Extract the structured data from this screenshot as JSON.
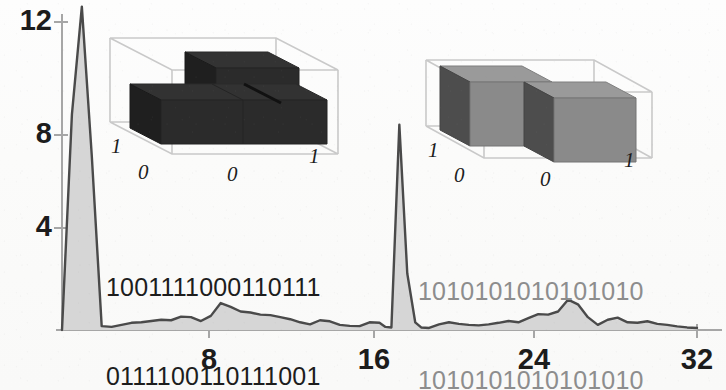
{
  "figure": {
    "kind": "scanned-scientific-figure",
    "background_color": "#fbfbfa"
  },
  "chart_data": {
    "type": "area",
    "title": "",
    "xlabel": "",
    "ylabel": "",
    "xlim": [
      0,
      32
    ],
    "ylim": [
      0,
      13.2
    ],
    "grid": false,
    "legend": null,
    "axis_color": "#8e8e8e",
    "line_color": "#4a4a4a",
    "fill_color": "#d6d6d6",
    "xticks": [
      8,
      16,
      24,
      32
    ],
    "xtick_labels": [
      "8",
      "16",
      "24",
      "32"
    ],
    "yticks": [
      4,
      8,
      12
    ],
    "ytick_labels": [
      "4",
      "8",
      "12"
    ],
    "series": [
      {
        "name": "spectrum",
        "x": [
          0,
          0.5,
          1.0,
          1.5,
          2.0,
          2.5,
          3.0,
          3.5,
          4.0,
          4.5,
          5.0,
          5.5,
          6.0,
          6.5,
          7.0,
          7.5,
          8.0,
          8.5,
          9.0,
          9.5,
          10.0,
          10.5,
          11.0,
          11.5,
          12.0,
          12.5,
          13.0,
          13.5,
          14.0,
          14.5,
          15.0,
          15.5,
          16.0,
          16.3,
          16.6,
          17.0,
          17.4,
          17.8,
          18.1,
          18.5,
          19.0,
          19.5,
          20.0,
          20.5,
          21.0,
          21.5,
          22.0,
          22.5,
          23.0,
          23.5,
          24.0,
          24.5,
          25.0,
          25.5,
          26.0,
          26.5,
          27.0,
          27.5,
          28.0,
          28.5,
          29.0,
          29.5,
          30.0,
          30.5,
          31.0,
          31.5,
          32.0
        ],
        "y": [
          0.0,
          8.4,
          12.6,
          6.8,
          0.15,
          0.12,
          0.2,
          0.28,
          0.3,
          0.35,
          0.4,
          0.38,
          0.52,
          0.5,
          0.35,
          0.55,
          1.05,
          0.9,
          0.72,
          0.68,
          0.6,
          0.58,
          0.5,
          0.42,
          0.3,
          0.22,
          0.38,
          0.34,
          0.2,
          0.16,
          0.15,
          0.3,
          0.28,
          0.12,
          0.1,
          8.0,
          2.2,
          0.3,
          0.1,
          0.08,
          0.22,
          0.3,
          0.24,
          0.2,
          0.18,
          0.22,
          0.28,
          0.35,
          0.3,
          0.46,
          0.62,
          0.6,
          0.72,
          1.18,
          1.0,
          0.5,
          0.2,
          0.4,
          0.48,
          0.3,
          0.28,
          0.34,
          0.24,
          0.2,
          0.14,
          0.1,
          0.08
        ]
      }
    ],
    "annotations": [
      {
        "name": "binary-left",
        "text_lines": [
          "1001111000110111",
          "0111100110111001"
        ],
        "color": "#1d1d1d"
      },
      {
        "name": "binary-right",
        "text_lines": [
          "1010101010101010",
          "1010101010101010"
        ],
        "color": "#8d8d8d"
      }
    ],
    "insets": [
      {
        "name": "inset-left",
        "type": "bar3d",
        "bar_color": "#2b2b2b",
        "bar_side_color": "#1c1c1c",
        "bar_top_color": "#333333",
        "frame_color": "#c9c9c9",
        "x_tick_labels": [
          "0",
          "1"
        ],
        "y_tick_labels": [
          "0",
          "1"
        ],
        "categories_x": [
          "0",
          "1"
        ],
        "categories_y": [
          "0",
          "1"
        ],
        "values": [
          [
            0.62,
            0.62
          ],
          [
            1.0,
            0.62
          ]
        ],
        "description": "3D bar chart, four bars, back-left bar tallest"
      },
      {
        "name": "inset-right",
        "type": "bar3d",
        "bar_color": "#8a8a8a",
        "bar_side_color": "#4e4e4e",
        "bar_top_color": "#9c9c9c",
        "frame_color": "#c9c9c9",
        "x_tick_labels": [
          "0",
          "1"
        ],
        "y_tick_labels": [
          "0",
          "1"
        ],
        "categories_x": [
          "0",
          "1"
        ],
        "categories_y": [
          "0",
          "1"
        ],
        "values": [
          [
            1.0,
            0.0
          ],
          [
            0.0,
            1.0
          ]
        ],
        "description": "3D bar chart, two diagonal bars of equal height"
      }
    ]
  }
}
